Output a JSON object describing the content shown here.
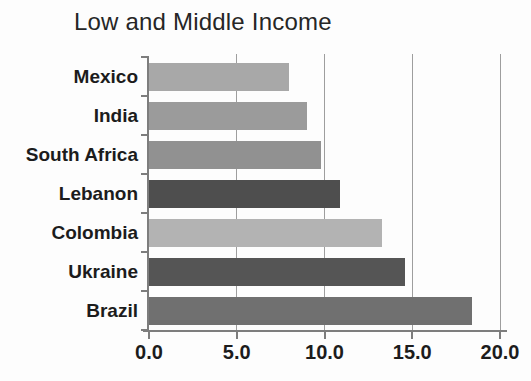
{
  "chart_data": {
    "type": "bar",
    "orientation": "horizontal",
    "title": "Low and Middle Income",
    "categories": [
      "Mexico",
      "India",
      "South Africa",
      "Lebanon",
      "Colombia",
      "Ukraine",
      "Brazil"
    ],
    "values": [
      8.0,
      9.0,
      9.8,
      10.9,
      13.3,
      14.6,
      18.4
    ],
    "bar_colors": [
      "#a8a8a8",
      "#9b9b9b",
      "#919191",
      "#4e4e4e",
      "#b3b3b3",
      "#555555",
      "#707070"
    ],
    "xlim": [
      0,
      20
    ],
    "xtick_values": [
      0,
      5,
      10,
      15,
      20
    ],
    "xtick_labels": [
      "0.0",
      "5.0",
      "10.0",
      "15.0",
      "20.0"
    ],
    "ylabel": "",
    "xlabel": "",
    "grid": "vertical gridlines at major x ticks, behind bars",
    "legend": "none"
  },
  "colors": {
    "axis": "#7d7d7d",
    "grid": "#9e9e9e",
    "text": "#1c1c1c",
    "background": "#fdfdfd"
  }
}
